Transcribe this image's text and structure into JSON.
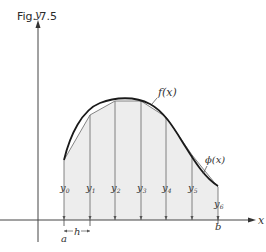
{
  "figure": {
    "title": "Fig. 7.5",
    "axes": {
      "x_label": "x",
      "y_label": "y"
    },
    "curve_label": "f(x)",
    "approx_label": "ϕ(x)",
    "interval": {
      "start_label": "a",
      "end_label": "b",
      "step_label": "h"
    },
    "ordinates": [
      {
        "label": "y",
        "sub": "0"
      },
      {
        "label": "y",
        "sub": "1"
      },
      {
        "label": "y",
        "sub": "2"
      },
      {
        "label": "y",
        "sub": "3"
      },
      {
        "label": "y",
        "sub": "4"
      },
      {
        "label": "y",
        "sub": "5"
      },
      {
        "label": "y",
        "sub": "6"
      }
    ],
    "colors": {
      "shade": "#ededed",
      "curve": "#1a1a1a",
      "lines": "#555555"
    }
  }
}
